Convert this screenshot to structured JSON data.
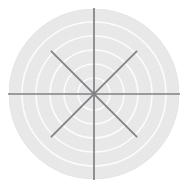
{
  "figure": {
    "name": "polar-grid",
    "width": 187,
    "height": 196,
    "background_color": "#ffffff",
    "caption": ""
  },
  "chart_data": {
    "type": "line",
    "subtype": "polar-grid-background",
    "title": "",
    "subtitle": "",
    "xlabel": "",
    "ylabel": "",
    "legend": [],
    "annotations": [],
    "grid": true,
    "legend_position": "none",
    "series": [],
    "polar": {
      "center_x": 94,
      "center_y": 94,
      "outer_radius": 85,
      "disk_fill": "#ececec",
      "disk_edge": "#e4e4e4",
      "ring_color": "#fbfbfb",
      "ring_width": 1.6,
      "ring_count": 5,
      "ring_radii": [
        16,
        30,
        44,
        58,
        72
      ],
      "ring_tick_labels": [
        "",
        "",
        "",
        "",
        ""
      ],
      "spoke_color": "#7f8083",
      "spoke_width": 1.7,
      "spoke_count": 8,
      "spoke_angles_deg": [
        0,
        45,
        90,
        135,
        180,
        225,
        270,
        315
      ],
      "spoke_tick_labels": [
        "",
        "",
        "",
        "",
        "",
        "",
        "",
        ""
      ],
      "spoke_radius_axis": 86,
      "spoke_radius_diagonal": 61,
      "rlim": [
        0,
        5
      ],
      "theta_direction": "counterclockwise",
      "theta_zero_location": "E"
    }
  }
}
